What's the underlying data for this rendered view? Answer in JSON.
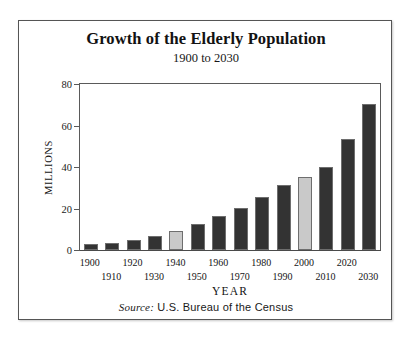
{
  "figure": {
    "title": "Growth of the Elderly Population",
    "subtitle": "1900 to 2030",
    "source_label": "Source:",
    "source_text": "U.S. Bureau of the Census",
    "colors": {
      "bar_dark": "#333333",
      "bar_light": "#c9c9c9",
      "bar_outline": "#6e6e6e",
      "axis": "#5a5a5a",
      "frame": "#555555",
      "text": "#121212"
    }
  },
  "chart_data": {
    "type": "bar",
    "title": "Growth of the Elderly Population",
    "subtitle": "1900 to 2030",
    "xlabel": "YEAR",
    "ylabel": "MILLIONS",
    "ylim": [
      0,
      80
    ],
    "yticks": [
      0,
      20,
      40,
      60,
      80
    ],
    "ytick_labels": [
      "0",
      "20",
      "40",
      "60",
      "80"
    ],
    "grid": false,
    "legend": "none",
    "annotation": "Source: U.S. Bureau of the Census",
    "categories": [
      "1900",
      "1910",
      "1920",
      "1930",
      "1940",
      "1950",
      "1960",
      "1970",
      "1980",
      "1990",
      "2000",
      "2010",
      "2020",
      "2030"
    ],
    "values": [
      3.1,
      3.4,
      4.9,
      6.6,
      9.0,
      12.3,
      16.6,
      20.1,
      25.7,
      31.2,
      35.0,
      40.2,
      53.7,
      70.3
    ],
    "bar_shades": [
      "dark",
      "dark",
      "dark",
      "dark",
      "light",
      "dark",
      "dark",
      "dark",
      "dark",
      "dark",
      "light",
      "dark",
      "dark",
      "dark"
    ],
    "label_rows": [
      "top",
      "bottom",
      "top",
      "bottom",
      "top",
      "bottom",
      "top",
      "bottom",
      "top",
      "bottom",
      "top",
      "bottom",
      "top",
      "bottom"
    ]
  }
}
